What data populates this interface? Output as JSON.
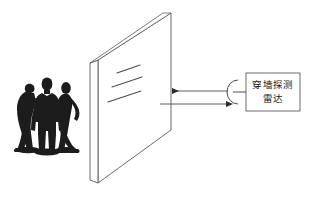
{
  "figure": {
    "title": "",
    "type": "through-wall-radar-detection-schematic",
    "background_color": "#ffffff",
    "line_color": "#555555",
    "dark_fill": "#1c1c1c"
  },
  "radar_box": {
    "line1": "穿墙探测",
    "line2": "雷达",
    "full_text": "穿墙探测雷达",
    "border_color": "#555555",
    "text_color": "#1a1a1a"
  },
  "antenna": {
    "name": "antenna-arc",
    "description": "left-opening arc attached to radar box"
  },
  "arrows": {
    "transmit": {
      "label": "",
      "direction": "left",
      "description": "signal from radar toward wall"
    },
    "receive": {
      "label": "",
      "direction": "right",
      "description": "reflected signal back to radar"
    }
  },
  "wall": {
    "name": "wall-slab",
    "description": "3D perspective wall panel with visible left edge thickness",
    "face_fill": "#ffffff",
    "edge_fill": "#fafafa"
  },
  "wave_lines": {
    "count": 3,
    "description": "three short diagonal lines depicting radar waves penetrating the wall"
  },
  "people": {
    "count": 3,
    "description": "three dark human silhouettes standing behind the wall",
    "fill": "#1c1c1c"
  }
}
